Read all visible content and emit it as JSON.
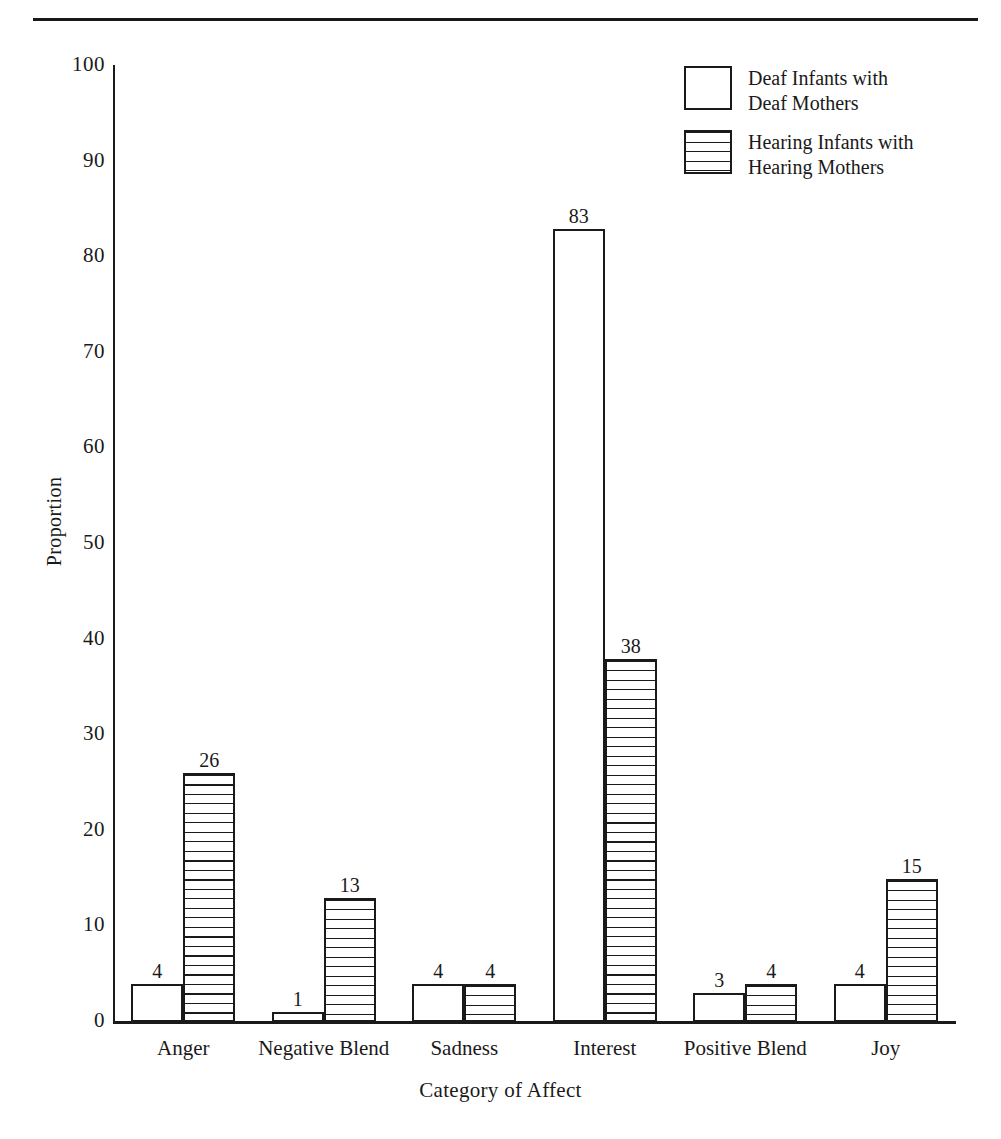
{
  "figure": {
    "rule_present": true
  },
  "chart_data": {
    "type": "bar",
    "title": "",
    "xlabel": "Category of Affect",
    "ylabel": "Proportion",
    "ylim": [
      0,
      100
    ],
    "yticks": [
      0,
      10,
      20,
      30,
      40,
      50,
      60,
      70,
      80,
      90,
      100
    ],
    "ytick_labels": [
      "0",
      "10",
      "20",
      "30",
      "40",
      "50",
      "60",
      "70",
      "80",
      "90",
      "100"
    ],
    "grid": false,
    "legend_position": "top-right",
    "categories": [
      "Anger",
      "Negative Blend",
      "Sadness",
      "Interest",
      "Positive Blend",
      "Joy"
    ],
    "series": [
      {
        "name": "Deaf Infants with\nDeaf Mothers",
        "fill": "white",
        "values": [
          4,
          1,
          4,
          83,
          3,
          4
        ],
        "labels": [
          "4",
          "1",
          "4",
          "83",
          "3",
          "4"
        ]
      },
      {
        "name": "Hearing Infants with\nHearing Mothers",
        "fill": "horizontal-stripes",
        "values": [
          26,
          13,
          4,
          38,
          4,
          15
        ],
        "labels": [
          "26",
          "13",
          "4",
          "38",
          "4",
          "15"
        ]
      }
    ],
    "colors": {
      "ink": "#1a1a1a",
      "background": "#ffffff"
    }
  }
}
